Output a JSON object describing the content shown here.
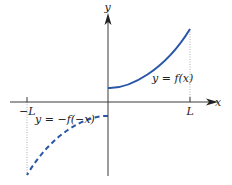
{
  "axes": {
    "x_label": "x",
    "y_label": "y",
    "tick_left_label": "−L",
    "tick_right_label": "L"
  },
  "curves": {
    "solid": {
      "label": "y = f(x)",
      "style": "solid",
      "color": "#2a56a6"
    },
    "dashed": {
      "label": "y = −f(−x)",
      "style": "dashed",
      "color": "#2a56a6"
    }
  },
  "colors": {
    "axis": "#3a3a3a",
    "guide": "#9a9a9a",
    "curve": "#2a56a6"
  }
}
